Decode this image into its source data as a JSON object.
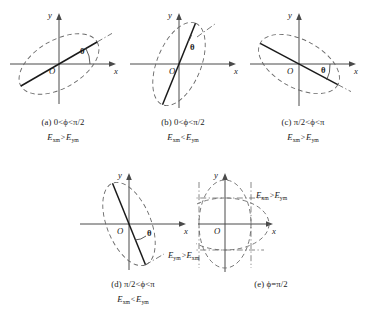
{
  "figure": {
    "panels": [
      {
        "id": "a",
        "caption_condition": "(a) 0<ϕ<π/2",
        "caption_amplitude": "Eₓₘ>Eᵧₘ",
        "amp_left_var": "E",
        "amp_left_sub": "xm",
        "amp_rel": ">",
        "amp_right_var": "E",
        "amp_right_sub": "ym",
        "axis_x_label": "x",
        "axis_y_label": "y",
        "origin_label": "O",
        "angle_label": "θ",
        "tilt_deg": 30,
        "ellipse_rx": 44,
        "ellipse_ry": 24
      },
      {
        "id": "b",
        "caption_condition": "(b) 0<ϕ<π/2",
        "caption_amplitude": "Eₓₘ<Eᵧₘ",
        "amp_left_var": "E",
        "amp_left_sub": "xm",
        "amp_rel": "<",
        "amp_right_var": "E",
        "amp_right_sub": "ym",
        "axis_x_label": "x",
        "axis_y_label": "y",
        "origin_label": "O",
        "angle_label": "θ",
        "tilt_deg": 68,
        "ellipse_rx": 44,
        "ellipse_ry": 22
      },
      {
        "id": "c",
        "caption_condition": "(c) π/2<ϕ<π",
        "caption_amplitude": "Eₓₘ>Eᵧₘ",
        "amp_left_var": "E",
        "amp_left_sub": "xm",
        "amp_rel": ">",
        "amp_right_var": "E",
        "amp_right_sub": "ym",
        "axis_x_label": "x",
        "axis_y_label": "y",
        "origin_label": "O",
        "angle_label": "θ",
        "tilt_deg": -28,
        "ellipse_rx": 44,
        "ellipse_ry": 24
      },
      {
        "id": "d",
        "caption_condition": "(d) π/2<ϕ<π",
        "caption_amplitude": "Eₓₘ<Eᵧₘ",
        "amp_left_var": "E",
        "amp_left_sub": "xm",
        "amp_rel": "<",
        "amp_right_var": "E",
        "amp_right_sub": "ym",
        "axis_x_label": "x",
        "axis_y_label": "y",
        "origin_label": "O",
        "angle_label": "θ",
        "tilt_deg": -68,
        "ellipse_rx": 44,
        "ellipse_ry": 22
      },
      {
        "id": "e",
        "caption_condition": "(e) ϕ=π/2",
        "caption_amplitude": "",
        "axis_x_label": "x",
        "axis_y_label": "y",
        "origin_label": "O",
        "label_upper_left_var": "E",
        "label_upper_left_sub": "xm",
        "label_upper_rel": ">",
        "label_upper_right_var": "E",
        "label_upper_right_sub": "ym",
        "label_lower_left_var": "E",
        "label_lower_left_sub": "ym",
        "label_lower_rel": ">",
        "label_lower_right_var": "E",
        "label_lower_right_sub": "xm",
        "wide_ellipse_rx": 44,
        "wide_ellipse_ry": 26,
        "tall_ellipse_rx": 26,
        "tall_ellipse_ry": 44
      }
    ]
  },
  "colors": {
    "ink": "#1a1a1a",
    "axis": "#4a4a4a",
    "curve": "#5a5a5a",
    "background": "#ffffff"
  }
}
